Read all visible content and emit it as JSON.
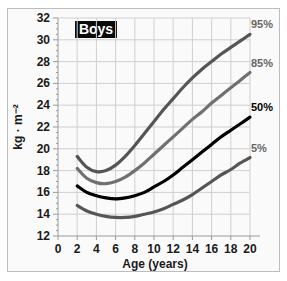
{
  "chart_data": {
    "type": "line",
    "title": "Boys",
    "xlabel": "Age (years)",
    "ylabel": "kg · m⁻²",
    "xlim": [
      0,
      20
    ],
    "ylim": [
      12,
      32
    ],
    "x_ticks": [
      0,
      2,
      4,
      6,
      8,
      10,
      12,
      14,
      16,
      18,
      20
    ],
    "y_ticks": [
      12,
      14,
      16,
      18,
      20,
      22,
      24,
      26,
      28,
      30,
      32
    ],
    "grid": true,
    "legend_position": "right end-of-line labels",
    "x": [
      2,
      3,
      4,
      5,
      6,
      7,
      8,
      9,
      10,
      11,
      12,
      13,
      14,
      15,
      16,
      17,
      18,
      19,
      20
    ],
    "series": [
      {
        "name": "95%",
        "color": "#555555",
        "bold_label": false,
        "values": [
          19.3,
          18.3,
          17.9,
          18.0,
          18.5,
          19.3,
          20.3,
          21.4,
          22.5,
          23.6,
          24.6,
          25.6,
          26.5,
          27.3,
          28.0,
          28.7,
          29.3,
          29.9,
          30.5
        ]
      },
      {
        "name": "85%",
        "color": "#707070",
        "bold_label": false,
        "values": [
          18.2,
          17.3,
          16.9,
          16.8,
          17.0,
          17.4,
          18.0,
          18.7,
          19.5,
          20.3,
          21.1,
          21.9,
          22.7,
          23.4,
          24.2,
          24.9,
          25.6,
          26.3,
          27.0
        ]
      },
      {
        "name": "50%",
        "color": "#000000",
        "bold_label": true,
        "values": [
          16.6,
          16.0,
          15.7,
          15.5,
          15.4,
          15.5,
          15.7,
          16.0,
          16.5,
          17.0,
          17.6,
          18.3,
          19.0,
          19.7,
          20.4,
          21.1,
          21.7,
          22.3,
          22.9
        ]
      },
      {
        "name": "5%",
        "color": "#555555",
        "bold_label": false,
        "values": [
          14.8,
          14.3,
          14.0,
          13.8,
          13.7,
          13.7,
          13.8,
          14.0,
          14.2,
          14.5,
          14.9,
          15.3,
          15.8,
          16.4,
          17.0,
          17.6,
          18.1,
          18.7,
          19.2
        ]
      }
    ]
  },
  "labels": {
    "title": "Boys",
    "xlabel": "Age (years)",
    "ylabel": "kg · m⁻²"
  }
}
